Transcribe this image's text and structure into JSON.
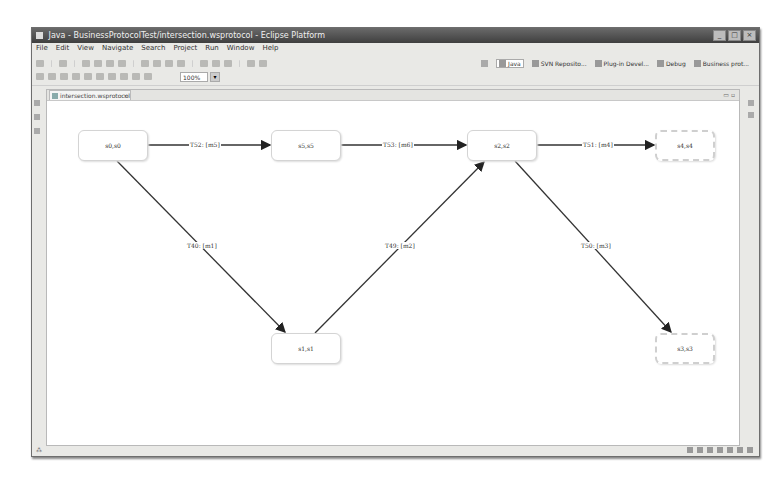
{
  "window": {
    "title": "Java - BusinessProtocolTest/intersection.wsprotocol - Eclipse Platform",
    "controls": [
      "minimize",
      "maximize",
      "close"
    ]
  },
  "menubar": [
    "File",
    "Edit",
    "View",
    "Navigate",
    "Search",
    "Project",
    "Run",
    "Window",
    "Help"
  ],
  "toolbar": {
    "zoom_value": "100%",
    "perspectives": [
      {
        "label": "Java",
        "active": true
      },
      {
        "label": "SVN Reposito...",
        "active": false
      },
      {
        "label": "Plug-in Devel...",
        "active": false
      },
      {
        "label": "Debug",
        "active": false
      },
      {
        "label": "Business prot...",
        "active": false
      }
    ]
  },
  "editor": {
    "tab_label": "intersection.wsprotocol",
    "tab_close": "×",
    "controls": "▭ ▫"
  },
  "diagram": {
    "nodes": [
      {
        "id": "s0",
        "label": "s0,s0",
        "x": 31,
        "y": 29,
        "w": 70,
        "h": 31,
        "final": false
      },
      {
        "id": "s5",
        "label": "s5,s5",
        "x": 224,
        "y": 29,
        "w": 70,
        "h": 31,
        "final": false
      },
      {
        "id": "s2",
        "label": "s2,s2",
        "x": 420,
        "y": 29,
        "w": 70,
        "h": 31,
        "final": false
      },
      {
        "id": "s4",
        "label": "s4,s4",
        "x": 608,
        "y": 29,
        "w": 60,
        "h": 31,
        "final": true
      },
      {
        "id": "s1",
        "label": "s1,s1",
        "x": 224,
        "y": 232,
        "w": 70,
        "h": 31,
        "final": false
      },
      {
        "id": "s3",
        "label": "s3,s3",
        "x": 608,
        "y": 232,
        "w": 60,
        "h": 31,
        "final": true
      }
    ],
    "edges": [
      {
        "from": "s0",
        "to": "s5",
        "label": "T52: [m5]",
        "lx": 142,
        "ly": 41
      },
      {
        "from": "s5",
        "to": "s2",
        "label": "T53: [m6]",
        "lx": 335,
        "ly": 41
      },
      {
        "from": "s2",
        "to": "s4",
        "label": "T51: [m4]",
        "lx": 535,
        "ly": 41
      },
      {
        "from": "s0",
        "to": "s1",
        "label": "T40: [m1]",
        "lx": 139,
        "ly": 145
      },
      {
        "from": "s1",
        "to": "s2",
        "label": "T49: [m2]",
        "lx": 337,
        "ly": 145
      },
      {
        "from": "s2",
        "to": "s3",
        "label": "T50: [m3]",
        "lx": 533,
        "ly": 145
      }
    ]
  },
  "statusbar": {
    "left_text": "⁂"
  }
}
